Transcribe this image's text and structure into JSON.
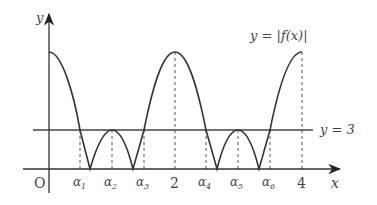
{
  "diagram": {
    "curve_label": "y = |f(x)|",
    "line_label": "y = 3",
    "axis_x_label": "x",
    "axis_y_label": "y",
    "origin_label": "O",
    "tick_labels": [
      {
        "id": "alpha1",
        "text": "α",
        "sub": "1"
      },
      {
        "id": "alpha2",
        "text": "α",
        "sub": "2"
      },
      {
        "id": "alpha3",
        "text": "α",
        "sub": "3"
      },
      {
        "id": "two",
        "text": "2"
      },
      {
        "id": "alpha4",
        "text": "α",
        "sub": "4"
      },
      {
        "id": "alpha5",
        "text": "α",
        "sub": "5"
      },
      {
        "id": "alpha6",
        "text": "α",
        "sub": "6"
      },
      {
        "id": "four",
        "text": "4"
      }
    ],
    "colors": {
      "curve": "#333333",
      "axis": "#444444",
      "dashed": "#555555"
    }
  }
}
